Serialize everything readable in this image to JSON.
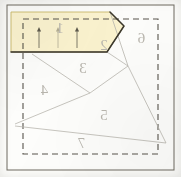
{
  "document": {
    "type": "paper-piecing-foundation-pattern",
    "title": "Foundation Piecing Block Diagram",
    "orientation": "mirror-reversed",
    "width": 181,
    "height": 177,
    "background_color": "#fdfdfb"
  },
  "colors": {
    "paper": "#fdfdfb",
    "highlight_fill": "#fbf3cf",
    "highlight_stroke": "#c9b96a",
    "active_edge_stroke": "#3c382c",
    "seam_line": "#b9b6ae",
    "dashed_line": "#58544c",
    "outer_frame": "#6e6a61",
    "label_text": "#b9b6ae",
    "arrow_mark": "#4a463c"
  },
  "outer_frame": {
    "name": "outer-frame",
    "style": "solid",
    "x": 7,
    "y": 5,
    "width": 167,
    "height": 165
  },
  "seam_allowance_boundary": {
    "name": "seam-allowance-boundary",
    "style": "dashed",
    "x": 23,
    "y": 19,
    "width": 135,
    "height": 135
  },
  "highlight_region": {
    "name": "active-section-highlight",
    "section": "1",
    "fill": "#fbf3cf",
    "description": "Currently active foundation section shaded yellow",
    "points": "11,12 110,12 124,26 107,52 11,52"
  },
  "sections": [
    {
      "id": "s1",
      "label": "1",
      "x": 60,
      "y": 33,
      "name": "section-1"
    },
    {
      "id": "s2",
      "label": "2",
      "x": 104,
      "y": 50,
      "name": "section-2"
    },
    {
      "id": "s3",
      "label": "3",
      "x": 83,
      "y": 73,
      "name": "section-3"
    },
    {
      "id": "s4",
      "label": "4",
      "x": 44,
      "y": 95,
      "name": "section-4"
    },
    {
      "id": "s5",
      "label": "5",
      "x": 104,
      "y": 120,
      "name": "section-5"
    },
    {
      "id": "s6",
      "label": "6",
      "x": 141,
      "y": 43,
      "name": "section-6"
    },
    {
      "id": "s7",
      "label": "7",
      "x": 81,
      "y": 148,
      "name": "section-7"
    }
  ],
  "direction_arrows": [
    {
      "id": "a1",
      "name": "fabric-direction-arrow-1",
      "x": 39,
      "y_top": 27,
      "y_bottom": 48,
      "opacity": 0.88
    },
    {
      "id": "a2",
      "name": "fabric-direction-arrow-2",
      "x": 58,
      "y_top": 27,
      "y_bottom": 48,
      "opacity": 0.4
    },
    {
      "id": "a3",
      "name": "fabric-direction-arrow-3",
      "x": 77,
      "y_top": 27,
      "y_bottom": 48,
      "opacity": 0.88
    }
  ],
  "seam_lines": [
    {
      "id": "L1",
      "name": "seam-line-1-3",
      "x1": 11,
      "y1": 52,
      "x2": 107,
      "y2": 52
    },
    {
      "id": "L2",
      "name": "seam-line-1-2-bevel",
      "x1": 110,
      "y1": 12,
      "x2": 124,
      "y2": 26
    },
    {
      "id": "L3",
      "name": "seam-line-2-bevel-lower",
      "x1": 124,
      "y1": 26,
      "x2": 107,
      "y2": 52
    },
    {
      "id": "L4",
      "name": "seam-line-2-6",
      "x1": 110,
      "y1": 12,
      "x2": 128,
      "y2": 66
    },
    {
      "id": "L5",
      "name": "seam-line-6-5",
      "x1": 128,
      "y1": 66,
      "x2": 166,
      "y2": 143
    },
    {
      "id": "L6",
      "name": "seam-line-3-4",
      "x1": 32,
      "y1": 54,
      "x2": 90,
      "y2": 93
    },
    {
      "id": "L7",
      "name": "seam-line-4-5",
      "x1": 90,
      "y1": 93,
      "x2": 128,
      "y2": 66
    },
    {
      "id": "L8",
      "name": "seam-line-4-7",
      "x1": 90,
      "y1": 93,
      "x2": 15,
      "y2": 124
    },
    {
      "id": "L9",
      "name": "seam-line-5-7",
      "x1": 15,
      "y1": 126,
      "x2": 166,
      "y2": 143
    },
    {
      "id": "L10",
      "name": "seam-line-3-right",
      "x1": 107,
      "y1": 52,
      "x2": 128,
      "y2": 66
    }
  ]
}
